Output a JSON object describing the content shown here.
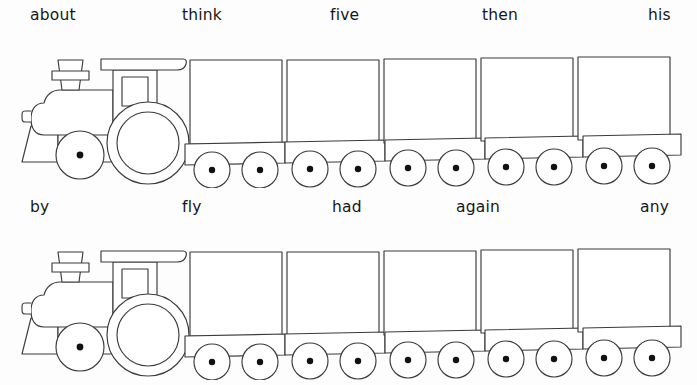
{
  "worksheet": {
    "title": "Sight Word Train Worksheet",
    "background_color": "#fdfdfd",
    "line_color": "#3b3b3b",
    "text_color": "#171717",
    "rows": [
      {
        "row_id": "train-row-1",
        "labels": [
          {
            "text": "about",
            "x": 30,
            "for": "locomotive"
          },
          {
            "text": "think",
            "x": 182,
            "for": "car-1"
          },
          {
            "text": "five",
            "x": 330,
            "for": "car-2"
          },
          {
            "text": "then",
            "x": 482,
            "for": "car-3"
          },
          {
            "text": "his",
            "x": 648,
            "for": "car-4"
          }
        ],
        "cars": 5
      },
      {
        "row_id": "train-row-2",
        "labels": [
          {
            "text": "by",
            "x": 30,
            "for": "locomotive"
          },
          {
            "text": "fly",
            "x": 182,
            "for": "car-1"
          },
          {
            "text": "had",
            "x": 332,
            "for": "car-2"
          },
          {
            "text": "again",
            "x": 456,
            "for": "car-3"
          },
          {
            "text": "any",
            "x": 640,
            "for": "car-4"
          }
        ],
        "cars": 5
      }
    ],
    "car_geometry": {
      "box_width": 92,
      "box_height": 84,
      "chassis_height": 21,
      "wheel_radius": 18,
      "hub_radius": 3.2,
      "starts": [
        190,
        287,
        384,
        481,
        578
      ]
    },
    "icon_names": {
      "locomotive": "locomotive-icon",
      "car": "train-car-icon",
      "wheel": "wheel-icon",
      "smokestack": "smokestack-icon",
      "cab": "cab-icon"
    }
  }
}
